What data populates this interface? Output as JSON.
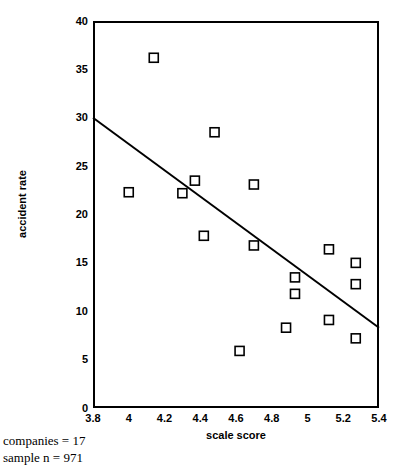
{
  "chart_data": {
    "type": "scatter",
    "title": "",
    "xlabel": "scale score",
    "ylabel": "accident rate",
    "xlim": [
      3.8,
      5.4
    ],
    "ylim": [
      0,
      40
    ],
    "xticks": [
      "3.8",
      "4",
      "4.2",
      "4.4",
      "4.6",
      "4.8",
      "5",
      "5.2",
      "5.4"
    ],
    "xtick_values": [
      3.8,
      4.0,
      4.2,
      4.4,
      4.6,
      4.8,
      5.0,
      5.2,
      5.4
    ],
    "yticks": [
      "0",
      "5",
      "10",
      "15",
      "20",
      "25",
      "30",
      "35",
      "40"
    ],
    "ytick_values": [
      0,
      5,
      10,
      15,
      20,
      25,
      30,
      35,
      40
    ],
    "grid": false,
    "legend": "none",
    "marker": "open-square",
    "marker_size": 9,
    "marker_color": "#000000",
    "points": [
      {
        "x": 4.14,
        "y": 36.2
      },
      {
        "x": 4.48,
        "y": 28.5
      },
      {
        "x": 4.37,
        "y": 23.5
      },
      {
        "x": 4.7,
        "y": 23.1
      },
      {
        "x": 4.0,
        "y": 22.3
      },
      {
        "x": 4.3,
        "y": 22.2
      },
      {
        "x": 4.42,
        "y": 17.8
      },
      {
        "x": 4.7,
        "y": 16.8
      },
      {
        "x": 5.12,
        "y": 16.4
      },
      {
        "x": 5.27,
        "y": 15.0
      },
      {
        "x": 4.93,
        "y": 13.5
      },
      {
        "x": 5.27,
        "y": 12.8
      },
      {
        "x": 4.93,
        "y": 11.8
      },
      {
        "x": 5.12,
        "y": 9.1
      },
      {
        "x": 4.88,
        "y": 8.3
      },
      {
        "x": 5.27,
        "y": 7.2
      },
      {
        "x": 4.62,
        "y": 5.9
      }
    ],
    "trend_line": {
      "type": "linear-fit",
      "x_start": 3.8,
      "y_start": 30.0,
      "x_end": 5.4,
      "y_end": 8.3,
      "color": "#000000",
      "width": 2
    },
    "annotations": [
      "companies = 17",
      "sample n = 971"
    ]
  }
}
